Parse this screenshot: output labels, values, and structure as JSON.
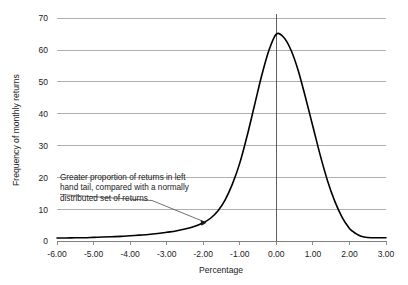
{
  "chart_data": {
    "type": "line",
    "title": "",
    "xlabel": "Percentage",
    "ylabel": "Frequency of monthly returns",
    "xlim": [
      -6.0,
      3.0
    ],
    "ylim": [
      0,
      70
    ],
    "grid": true,
    "legend": "none",
    "x_ticks": [
      "-6.00",
      "-5.00",
      "-4.00",
      "-3.00",
      "-2.00",
      "-1.00",
      "0.00",
      "1.00",
      "2.00",
      "3.00"
    ],
    "x_tick_values": [
      -6,
      -5,
      -4,
      -3,
      -2,
      -1,
      0,
      1,
      2,
      3
    ],
    "y_ticks": [
      "0",
      "10",
      "20",
      "30",
      "40",
      "50",
      "60",
      "70"
    ],
    "y_tick_values": [
      0,
      10,
      20,
      30,
      40,
      50,
      60,
      70
    ],
    "reference_line_x": 0.0,
    "peak": {
      "x": 0.0,
      "y": 65
    },
    "series": [
      {
        "name": "Frequency of monthly returns",
        "x": [
          -6.0,
          -5.75,
          -5.5,
          -5.25,
          -5.0,
          -4.75,
          -4.5,
          -4.25,
          -4.0,
          -3.75,
          -3.5,
          -3.25,
          -3.0,
          -2.75,
          -2.5,
          -2.25,
          -2.0,
          -1.8,
          -1.6,
          -1.4,
          -1.2,
          -1.0,
          -0.8,
          -0.6,
          -0.4,
          -0.2,
          0.0,
          0.2,
          0.4,
          0.6,
          0.8,
          1.0,
          1.2,
          1.4,
          1.6,
          1.8,
          2.0,
          2.1,
          2.2,
          2.3,
          2.4,
          2.6,
          2.8,
          3.0
        ],
        "y": [
          1.0,
          1.0,
          1.1,
          1.1,
          1.2,
          1.3,
          1.4,
          1.5,
          1.7,
          1.9,
          2.1,
          2.4,
          2.8,
          3.2,
          3.8,
          4.6,
          5.8,
          7.2,
          9.5,
          13.0,
          18.0,
          24.5,
          33.0,
          42.5,
          52.0,
          60.0,
          65.0,
          64.0,
          60.0,
          53.5,
          45.0,
          36.0,
          27.0,
          19.0,
          12.5,
          7.5,
          4.0,
          3.0,
          2.2,
          1.6,
          1.3,
          1.1,
          1.1,
          1.1
        ]
      }
    ],
    "annotations": [
      {
        "name": "left-tail-annotation",
        "lines": [
          "Greater proportion of returns in left",
          "hand tail, compared with a normally",
          "distributed set of returns"
        ],
        "points_to": {
          "x": -1.75,
          "y": 5.0
        }
      }
    ]
  }
}
